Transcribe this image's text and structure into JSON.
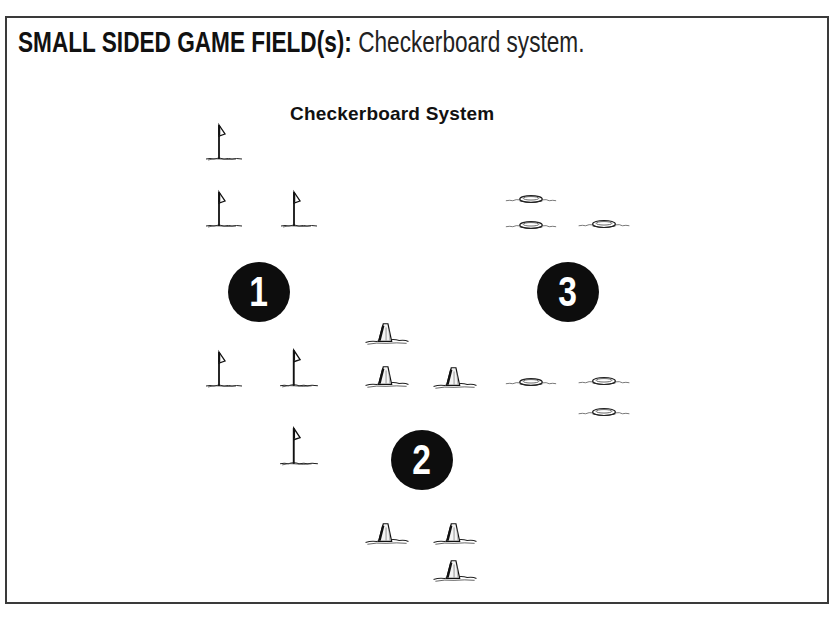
{
  "header": {
    "title_bold": "SMALL SIDED GAME FIELD(s):",
    "title_rest": " Checkerboard system."
  },
  "diagram": {
    "subtitle": "Checkerboard System",
    "fields": [
      {
        "label": "1",
        "marker_type": "flag-icon"
      },
      {
        "label": "2",
        "marker_type": "cone-icon"
      },
      {
        "label": "3",
        "marker_type": "disc-cone-icon"
      }
    ],
    "colors": {
      "ink": "#111111",
      "badge": "#0d0d0d",
      "background": "#ffffff"
    }
  }
}
